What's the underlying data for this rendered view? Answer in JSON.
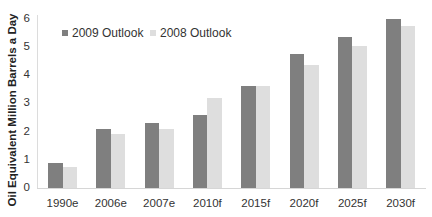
{
  "chart_data": {
    "type": "bar",
    "title": "",
    "xlabel": "",
    "ylabel": "Oil Equivalent Million Barrels a Day",
    "ylim": [
      0,
      6
    ],
    "yticks": [
      "0",
      "1",
      "2",
      "3",
      "4",
      "5",
      "6"
    ],
    "categories": [
      "1990e",
      "2006e",
      "2007e",
      "2010f",
      "2015f",
      "2020f",
      "2025f",
      "2030f"
    ],
    "series": [
      {
        "name": "2009 Outlook",
        "color": "#7f7f7f",
        "values": [
          0.9,
          2.1,
          2.3,
          2.6,
          3.6,
          4.75,
          5.35,
          6.0
        ]
      },
      {
        "name": "2008 Outlook",
        "color": "#dedede",
        "values": [
          0.75,
          1.9,
          2.1,
          3.2,
          3.6,
          4.35,
          5.05,
          5.75
        ]
      }
    ],
    "legend_position": "top-left inside",
    "grid": false
  }
}
